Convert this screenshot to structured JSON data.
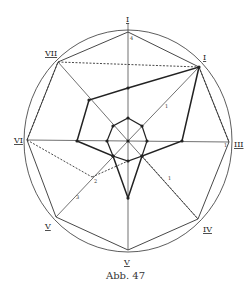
{
  "figure": {
    "caption": "Abb. 47",
    "center": [
      128,
      141
    ],
    "circle": {
      "rx": 104,
      "ry": 111
    },
    "spokes": [
      {
        "label": "I",
        "outer": [
          128,
          32
        ],
        "label_pos": [
          126,
          22
        ]
      },
      {
        "label": "I",
        "outer": [
          199,
          67
        ],
        "label_pos": [
          203,
          60
        ]
      },
      {
        "label": "III",
        "outer": [
          229,
          142
        ],
        "label_pos": [
          234,
          147
        ]
      },
      {
        "label": "IV",
        "outer": [
          198,
          219
        ],
        "label_pos": [
          203,
          232
        ]
      },
      {
        "label": "V",
        "outer": [
          128,
          250
        ],
        "label_pos": [
          124,
          265
        ]
      },
      {
        "label": "V",
        "outer": [
          56,
          217
        ],
        "label_pos": [
          45,
          229
        ]
      },
      {
        "label": "VI",
        "outer": [
          27,
          140
        ],
        "label_pos": [
          14,
          143
        ]
      },
      {
        "label": "VII",
        "outer": [
          58,
          62
        ],
        "label_pos": [
          45,
          56
        ]
      }
    ],
    "inner_polygon": [
      [
        128,
        118
      ],
      [
        142,
        126
      ],
      [
        147,
        141
      ],
      [
        142,
        156
      ],
      [
        128,
        161
      ],
      [
        113,
        156
      ],
      [
        107,
        141
      ],
      [
        113,
        126
      ]
    ],
    "bold_polygon": [
      [
        199,
        67
      ],
      [
        182,
        141
      ],
      [
        142,
        156
      ],
      [
        128,
        198
      ],
      [
        113,
        156
      ],
      [
        77,
        141
      ],
      [
        89,
        100
      ],
      [
        128,
        88
      ]
    ],
    "dashed_lines": [
      [
        [
          58,
          62
        ],
        [
          199,
          67
        ]
      ],
      [
        [
          27,
          140
        ],
        [
          92,
          177
        ]
      ],
      [
        [
          92,
          177
        ],
        [
          128,
          161
        ]
      ],
      [
        [
          142,
          156
        ],
        [
          198,
          219
        ]
      ],
      [
        [
          199,
          67
        ],
        [
          229,
          142
        ]
      ],
      [
        [
          27,
          140
        ],
        [
          58,
          62
        ]
      ]
    ],
    "tick_labels": [
      {
        "text": "1",
        "pos": [
          165,
          108
        ]
      },
      {
        "text": "1",
        "pos": [
          168,
          180
        ]
      },
      {
        "text": "2",
        "pos": [
          94,
          183
        ]
      },
      {
        "text": "3",
        "pos": [
          76,
          199
        ]
      },
      {
        "text": "4",
        "pos": [
          130,
          40
        ]
      },
      {
        "text": "1",
        "pos": [
          224,
          147
        ]
      }
    ]
  }
}
